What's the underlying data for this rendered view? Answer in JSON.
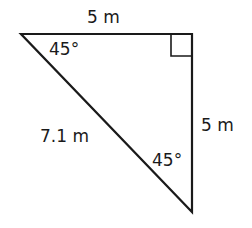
{
  "diagram": {
    "type": "right-triangle",
    "labels": {
      "top_side": "5 m",
      "right_side": "5 m",
      "hypotenuse": "7.1 m",
      "top_left_angle": "45°",
      "bottom_angle": "45°"
    },
    "right_angle_marker": "top-right",
    "stroke_color": "#1a1a1a"
  }
}
